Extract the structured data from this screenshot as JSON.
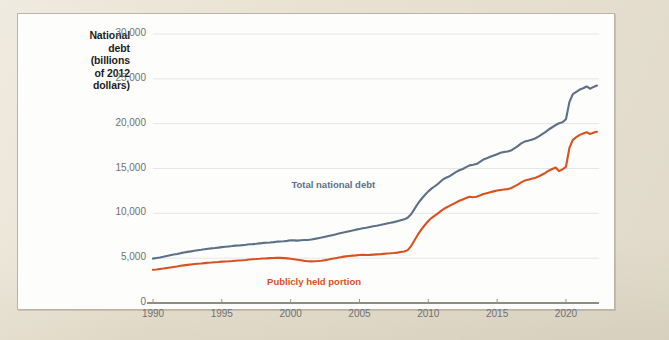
{
  "figure": {
    "mat_color": "#e9e2d2",
    "card_color": "#fdfdfc",
    "card_border_color": "#b9b4a6"
  },
  "axis_title": {
    "line1": "National",
    "line2": "debt",
    "line3": "(billions",
    "line4": "of 2012",
    "line5": "dollars)"
  },
  "chart_data": {
    "type": "line",
    "title": "",
    "subtitle": "",
    "xlabel": "",
    "ylabel": "National debt (billions of 2012 dollars)",
    "xlim": [
      1990,
      2022.4
    ],
    "ylim": [
      0,
      30000
    ],
    "xticks": [
      1990,
      1995,
      2000,
      2005,
      2010,
      2015,
      2020
    ],
    "xtick_labels": [
      "1990",
      "1995",
      "2000",
      "2005",
      "2010",
      "2015",
      "2020"
    ],
    "yticks": [
      0,
      5000,
      10000,
      15000,
      20000,
      25000,
      30000
    ],
    "ytick_labels": [
      "0",
      "5,000",
      "10,000",
      "15,000",
      "20,000",
      "25,000",
      "30,000"
    ],
    "grid": true,
    "grid_axis": "y",
    "grid_color": "#e6e6e6",
    "legend": "inline-annotations",
    "series": [
      {
        "name": "Total national debt",
        "color": "#5c7087",
        "label_x": 2003.1,
        "label_y": 13050,
        "x": [
          1990,
          1990.25,
          1990.5,
          1990.75,
          1991,
          1991.25,
          1991.5,
          1991.75,
          1992,
          1992.25,
          1992.5,
          1992.75,
          1993,
          1993.25,
          1993.5,
          1993.75,
          1994,
          1994.25,
          1994.5,
          1994.75,
          1995,
          1995.25,
          1995.5,
          1995.75,
          1996,
          1996.25,
          1996.5,
          1996.75,
          1997,
          1997.25,
          1997.5,
          1997.75,
          1998,
          1998.25,
          1998.5,
          1998.75,
          1999,
          1999.25,
          1999.5,
          1999.75,
          2000,
          2000.25,
          2000.5,
          2000.75,
          2001,
          2001.25,
          2001.5,
          2001.75,
          2002,
          2002.25,
          2002.5,
          2002.75,
          2003,
          2003.25,
          2003.5,
          2003.75,
          2004,
          2004.25,
          2004.5,
          2004.75,
          2005,
          2005.25,
          2005.5,
          2005.75,
          2006,
          2006.25,
          2006.5,
          2006.75,
          2007,
          2007.25,
          2007.5,
          2007.75,
          2008,
          2008.25,
          2008.5,
          2008.75,
          2009,
          2009.25,
          2009.5,
          2009.75,
          2010,
          2010.25,
          2010.5,
          2010.75,
          2011,
          2011.25,
          2011.5,
          2011.75,
          2012,
          2012.25,
          2012.5,
          2012.75,
          2013,
          2013.25,
          2013.5,
          2013.75,
          2014,
          2014.25,
          2014.5,
          2014.75,
          2015,
          2015.25,
          2015.5,
          2015.75,
          2016,
          2016.25,
          2016.5,
          2016.75,
          2017,
          2017.25,
          2017.5,
          2017.75,
          2018,
          2018.25,
          2018.5,
          2018.75,
          2019,
          2019.25,
          2019.5,
          2019.75,
          2020,
          2020.25,
          2020.5,
          2020.75,
          2021,
          2021.25,
          2021.5,
          2021.75,
          2022,
          2022.25
        ],
        "y": [
          4950,
          5010,
          5070,
          5150,
          5240,
          5320,
          5400,
          5470,
          5560,
          5640,
          5700,
          5760,
          5830,
          5880,
          5930,
          5990,
          6050,
          6090,
          6130,
          6180,
          6230,
          6270,
          6310,
          6350,
          6400,
          6420,
          6450,
          6500,
          6560,
          6570,
          6600,
          6650,
          6700,
          6720,
          6750,
          6790,
          6840,
          6860,
          6880,
          6930,
          6990,
          6980,
          6960,
          6990,
          7020,
          7030,
          7080,
          7150,
          7230,
          7300,
          7380,
          7470,
          7560,
          7650,
          7740,
          7830,
          7920,
          8010,
          8090,
          8180,
          8260,
          8330,
          8400,
          8480,
          8560,
          8620,
          8690,
          8780,
          8870,
          8940,
          9020,
          9120,
          9230,
          9330,
          9500,
          9900,
          10500,
          11100,
          11600,
          12050,
          12450,
          12780,
          13050,
          13350,
          13700,
          13950,
          14100,
          14350,
          14600,
          14800,
          14950,
          15150,
          15350,
          15420,
          15500,
          15750,
          16000,
          16150,
          16300,
          16450,
          16600,
          16750,
          16850,
          16900,
          17000,
          17250,
          17500,
          17800,
          18000,
          18100,
          18200,
          18350,
          18550,
          18800,
          19050,
          19350,
          19600,
          19850,
          20050,
          20150,
          20500,
          22400,
          23300,
          23550,
          23800,
          23950,
          24150,
          23900,
          24100,
          24250
        ]
      },
      {
        "name": "Publicly held portion",
        "color": "#d9511f",
        "label_x": 2001.7,
        "label_y": 2250,
        "x": [
          1990,
          1990.25,
          1990.5,
          1990.75,
          1991,
          1991.25,
          1991.5,
          1991.75,
          1992,
          1992.25,
          1992.5,
          1992.75,
          1993,
          1993.25,
          1993.5,
          1993.75,
          1994,
          1994.25,
          1994.5,
          1994.75,
          1995,
          1995.25,
          1995.5,
          1995.75,
          1996,
          1996.25,
          1996.5,
          1996.75,
          1997,
          1997.25,
          1997.5,
          1997.75,
          1998,
          1998.25,
          1998.5,
          1998.75,
          1999,
          1999.25,
          1999.5,
          1999.75,
          2000,
          2000.25,
          2000.5,
          2000.75,
          2001,
          2001.25,
          2001.5,
          2001.75,
          2002,
          2002.25,
          2002.5,
          2002.75,
          2003,
          2003.25,
          2003.5,
          2003.75,
          2004,
          2004.25,
          2004.5,
          2004.75,
          2005,
          2005.25,
          2005.5,
          2005.75,
          2006,
          2006.25,
          2006.5,
          2006.75,
          2007,
          2007.25,
          2007.5,
          2007.75,
          2008,
          2008.25,
          2008.5,
          2008.75,
          2009,
          2009.25,
          2009.5,
          2009.75,
          2010,
          2010.25,
          2010.5,
          2010.75,
          2011,
          2011.25,
          2011.5,
          2011.75,
          2012,
          2012.25,
          2012.5,
          2012.75,
          2013,
          2013.25,
          2013.5,
          2013.75,
          2014,
          2014.25,
          2014.5,
          2014.75,
          2015,
          2015.25,
          2015.5,
          2015.75,
          2016,
          2016.25,
          2016.5,
          2016.75,
          2017,
          2017.25,
          2017.5,
          2017.75,
          2018,
          2018.25,
          2018.5,
          2018.75,
          2019,
          2019.25,
          2019.5,
          2019.75,
          2020,
          2020.25,
          2020.5,
          2020.75,
          2021,
          2021.25,
          2021.5,
          2021.75,
          2022,
          2022.25
        ],
        "y": [
          3700,
          3740,
          3790,
          3840,
          3900,
          3960,
          4020,
          4080,
          4150,
          4200,
          4250,
          4300,
          4350,
          4380,
          4410,
          4450,
          4490,
          4510,
          4540,
          4570,
          4610,
          4630,
          4650,
          4680,
          4720,
          4740,
          4760,
          4800,
          4850,
          4880,
          4900,
          4930,
          4970,
          4980,
          5000,
          5020,
          5050,
          5030,
          5010,
          4980,
          4940,
          4880,
          4820,
          4760,
          4700,
          4660,
          4640,
          4650,
          4680,
          4720,
          4780,
          4850,
          4930,
          5000,
          5070,
          5140,
          5200,
          5250,
          5280,
          5310,
          5350,
          5370,
          5360,
          5370,
          5400,
          5420,
          5440,
          5480,
          5520,
          5540,
          5570,
          5620,
          5680,
          5740,
          5900,
          6350,
          7000,
          7650,
          8200,
          8700,
          9150,
          9500,
          9780,
          10050,
          10350,
          10600,
          10800,
          11000,
          11200,
          11400,
          11550,
          11700,
          11850,
          11800,
          11850,
          12000,
          12150,
          12250,
          12350,
          12450,
          12550,
          12600,
          12650,
          12700,
          12800,
          13000,
          13200,
          13450,
          13650,
          13750,
          13850,
          13950,
          14100,
          14300,
          14500,
          14750,
          14950,
          15100,
          14700,
          14900,
          15200,
          17300,
          18200,
          18500,
          18750,
          18900,
          19050,
          18850,
          19000,
          19100
        ]
      }
    ]
  }
}
